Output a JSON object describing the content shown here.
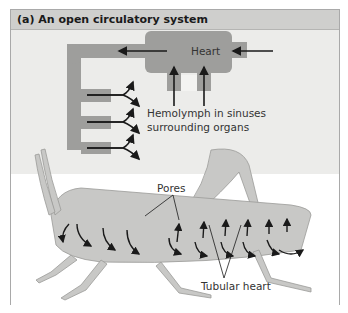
{
  "figure": {
    "title": "(a) An open circulatory system",
    "labels": {
      "heart": "Heart",
      "hemolymph_line1": "Hemolymph in sinuses",
      "hemolymph_line2": "surrounding organs",
      "pores": "Pores",
      "tubular_heart": "Tubular heart"
    },
    "colors": {
      "title_bar": "#cfcfcd",
      "schematic_bg": "#ececea",
      "vessel": "#9e9e9c",
      "arrow": "#1a1a1a",
      "insect_body": "#c8c8c6"
    }
  }
}
